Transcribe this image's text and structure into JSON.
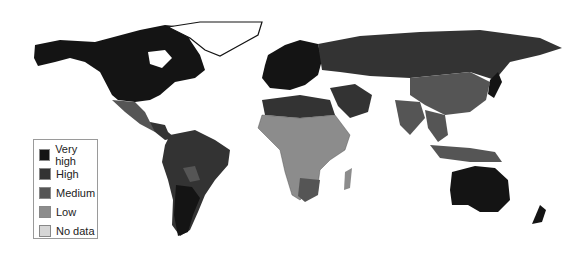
{
  "map": {
    "type": "choropleth-world",
    "colors": {
      "very_high": "#141414",
      "high": "#333333",
      "medium": "#555555",
      "low": "#8c8c8c",
      "no_data": "#d6d6d6",
      "ocean": "#ffffff"
    }
  },
  "legend": {
    "items": [
      {
        "label": "Very high",
        "color": "#141414"
      },
      {
        "label": "High",
        "color": "#333333"
      },
      {
        "label": "Medium",
        "color": "#555555"
      },
      {
        "label": "Low",
        "color": "#8c8c8c"
      },
      {
        "label": "No data",
        "color": "#d6d6d6"
      }
    ]
  }
}
